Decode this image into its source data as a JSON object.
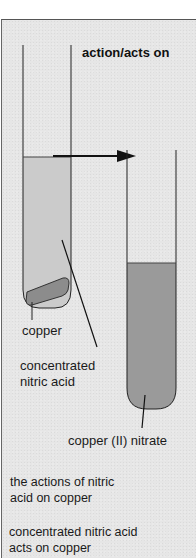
{
  "diagram": {
    "title": "action/acts on",
    "labels": {
      "copper": "copper",
      "acid_line1": "concentrated",
      "acid_line2": "nitric acid",
      "nitrate": "copper (II) nitrate"
    },
    "captions": [
      {
        "line1": "the actions of nitric",
        "line2": "acid on copper"
      },
      {
        "line1": "concentrated nitric acid",
        "line2": "acts on copper"
      }
    ],
    "elements": {
      "left_tube": "test tube with concentrated nitric acid and copper piece",
      "arrow": "right-arrow",
      "right_tube": "test tube with copper (II) nitrate solution"
    },
    "colors": {
      "background": "#e6e6e6",
      "acid_fill": "#cbcbcb",
      "nitrate_fill": "#9a9a9a",
      "copper_fill": "#8c8c8c",
      "line": "#222222"
    }
  }
}
